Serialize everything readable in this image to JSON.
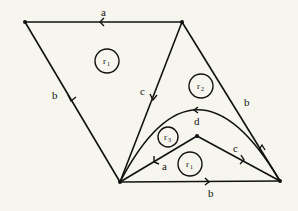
{
  "diagram": {
    "background": "#f7f6ee",
    "stroke_color": "#111111",
    "vertices": [
      {
        "id": "top-left",
        "x": 25,
        "y": 22
      },
      {
        "id": "top-right",
        "x": 182,
        "y": 22
      },
      {
        "id": "bottom-left",
        "x": 120,
        "y": 182
      },
      {
        "id": "bottom-right",
        "x": 280,
        "y": 181
      },
      {
        "id": "inner",
        "x": 197,
        "y": 136
      }
    ],
    "edges": [
      {
        "from": "top-right",
        "to": "top-left",
        "label": "a"
      },
      {
        "from": "top-left",
        "to": "bottom-left",
        "label": "b"
      },
      {
        "from": "top-right",
        "to": "bottom-left",
        "label": "c"
      },
      {
        "from": "bottom-right",
        "to": "top-right",
        "label": "b"
      },
      {
        "from": "bottom-right",
        "to": "bottom-left",
        "label": "d",
        "curved": true
      },
      {
        "from": "inner",
        "to": "bottom-left",
        "label": "a"
      },
      {
        "from": "inner",
        "to": "bottom-right",
        "label": "c"
      },
      {
        "from": "bottom-left",
        "to": "bottom-right",
        "label": "b"
      }
    ],
    "labels": {
      "top_a": "a",
      "left_b": "b",
      "mid_c": "c",
      "right_b": "b",
      "curve_d": "d",
      "inner_a": "a",
      "inner_c": "c",
      "bottom_b": "b"
    },
    "regions": [
      {
        "name": "r",
        "sub": "1",
        "x": 107,
        "y": 61
      },
      {
        "name": "r",
        "sub": "2",
        "x": 201,
        "y": 86
      },
      {
        "name": "r",
        "sub": "3",
        "x": 168,
        "y": 137
      },
      {
        "name": "r",
        "sub": "1",
        "x": 190,
        "y": 164
      }
    ]
  }
}
